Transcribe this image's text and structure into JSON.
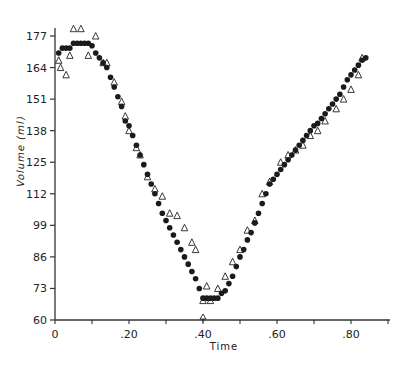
{
  "chart_data": {
    "type": "scatter",
    "title": "",
    "xlabel": "Time",
    "ylabel": "Volume (ml)",
    "xlim": [
      0,
      90
    ],
    "ylim": [
      60,
      177
    ],
    "x_ticks": [
      0,
      10,
      20,
      30,
      40,
      50,
      60,
      70,
      80,
      90
    ],
    "x_tick_labels": [
      "0",
      "",
      ".20",
      "",
      ".40",
      "",
      ".60",
      "",
      ".80",
      ""
    ],
    "y_ticks": [
      60,
      73,
      86,
      99,
      112,
      125,
      138,
      151,
      164,
      177
    ],
    "y_tick_labels": [
      "60",
      "73",
      "86",
      "99",
      "112",
      "125",
      "138",
      "151",
      "164",
      "177"
    ],
    "grid": false,
    "legend": null,
    "annotations": [
      {
        "text": "arrow",
        "x": 40,
        "y": 60
      }
    ],
    "series": [
      {
        "name": "filled circles",
        "marker": "circle-filled",
        "x": [
          1,
          2,
          3,
          4,
          5,
          6,
          7,
          8,
          9,
          10,
          11,
          12,
          13,
          14,
          15,
          16,
          17,
          18,
          19,
          20,
          21,
          22,
          23,
          24,
          25,
          26,
          27,
          28,
          29,
          30,
          31,
          32,
          33,
          34,
          35,
          36,
          37,
          38,
          39,
          40,
          41,
          42,
          43,
          44,
          45,
          46,
          47,
          48,
          49,
          50,
          51,
          52,
          53,
          54,
          55,
          56,
          57,
          58,
          59,
          60,
          61,
          62,
          63,
          64,
          65,
          66,
          67,
          68,
          69,
          70,
          71,
          72,
          73,
          74,
          75,
          76,
          77,
          78,
          79,
          80,
          81,
          82,
          83,
          84
        ],
        "y": [
          170,
          172,
          172,
          172,
          174,
          174,
          174,
          174,
          174,
          173,
          170,
          168,
          166,
          164,
          160,
          156,
          152,
          148,
          142,
          140,
          136,
          132,
          128,
          124,
          120,
          116,
          112,
          108,
          104,
          101,
          98,
          95,
          92,
          89,
          86,
          83,
          80,
          77,
          73,
          69,
          69,
          69,
          69,
          69,
          71,
          72,
          75,
          78,
          82,
          86,
          89,
          93,
          96,
          100,
          104,
          108,
          112,
          116,
          118,
          120,
          122,
          124,
          126,
          128,
          130,
          132,
          134,
          136,
          138,
          140,
          141,
          143,
          145,
          147,
          149,
          151,
          153,
          156,
          159,
          161,
          163,
          165,
          167,
          168
        ]
      },
      {
        "name": "open triangles",
        "marker": "triangle-open",
        "x": [
          1,
          1.5,
          3,
          4,
          5,
          7,
          9,
          11,
          13,
          14,
          16,
          18,
          19,
          20,
          22,
          23,
          25,
          27,
          29,
          31,
          33,
          35,
          37,
          38,
          40,
          41,
          42,
          44,
          46,
          48,
          50,
          52,
          54,
          56,
          58,
          61,
          63,
          65,
          67,
          69,
          71,
          73,
          76,
          78,
          80,
          82,
          83
        ],
        "y": [
          167,
          164,
          161,
          169,
          180,
          180,
          169,
          177,
          166,
          166,
          158,
          150,
          144,
          138,
          131,
          128,
          119,
          114,
          111,
          104,
          103,
          98,
          92,
          89,
          68,
          74,
          68,
          73,
          78,
          84,
          89,
          97,
          101,
          112,
          117,
          125,
          128,
          130,
          132,
          136,
          138,
          142,
          147,
          151,
          155,
          161,
          168
        ]
      }
    ]
  }
}
